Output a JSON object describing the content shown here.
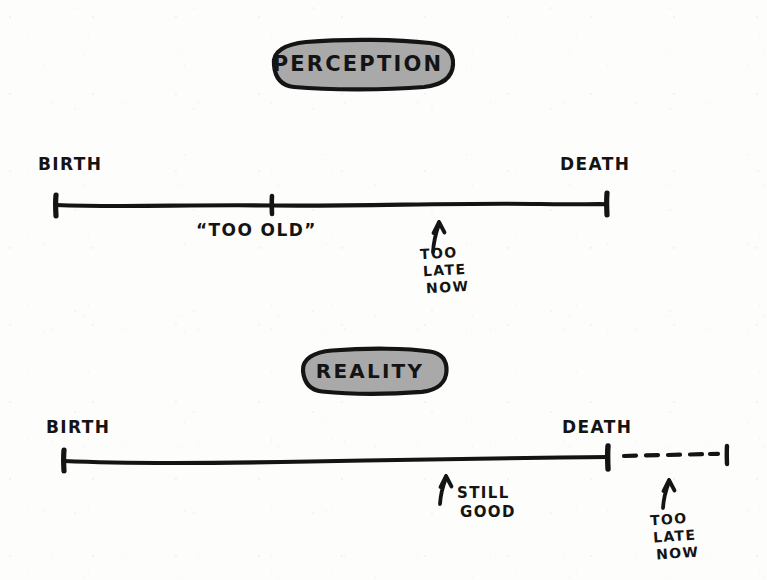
{
  "figure": {
    "title_note": "hand-drawn two-panel timeline comparing perception and reality of age",
    "ink_color": "#141414",
    "badge_fill": "#a9a9a9",
    "paper_color": "#fdfdfc"
  },
  "panels": [
    {
      "id": "perception",
      "badge_label": "PERCEPTION",
      "start_label": "BIRTH",
      "end_label": "DEATH",
      "midpoint_label": "“TOO OLD”",
      "arrow_note_lines": [
        "TOO",
        "LATE",
        "NOW"
      ],
      "has_dashed_extension": false
    },
    {
      "id": "reality",
      "badge_label": "REALITY",
      "start_label": "BIRTH",
      "end_label": "DEATH",
      "arrow_note_one_lines": [
        "STILL",
        "GOOD"
      ],
      "arrow_note_two_lines": [
        "TOO",
        "LATE",
        "NOW"
      ],
      "has_dashed_extension": true
    }
  ]
}
